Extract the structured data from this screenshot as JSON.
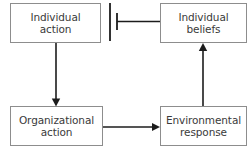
{
  "diagram": {
    "background_color": "#ffffff",
    "box_border_color": "#8d8d8d",
    "connector_color": "#1c1c1c",
    "nodes": [
      {
        "id": "individual-action",
        "label": "Individual\naction",
        "position": "top-left"
      },
      {
        "id": "individual-beliefs",
        "label": "Individual\nbeliefs",
        "position": "top-right"
      },
      {
        "id": "organizational-action",
        "label": "Organizational\naction",
        "position": "bottom-left"
      },
      {
        "id": "environmental-response",
        "label": "Environmental\nresponse",
        "position": "bottom-right"
      }
    ],
    "connectors": [
      {
        "id": "individual-action-to-organizational-action",
        "from": "individual-action",
        "to": "organizational-action",
        "direction": "down",
        "terminator": "arrowhead"
      },
      {
        "id": "organizational-action-to-environmental-response",
        "from": "organizational-action",
        "to": "environmental-response",
        "direction": "right",
        "terminator": "arrowhead"
      },
      {
        "id": "environmental-response-to-individual-beliefs",
        "from": "environmental-response",
        "to": "individual-beliefs",
        "direction": "up",
        "terminator": "arrowhead"
      },
      {
        "id": "individual-beliefs-to-individual-action",
        "from": "individual-beliefs",
        "to": "individual-action",
        "direction": "left",
        "terminator": "blocked-t-bar"
      }
    ],
    "barrier": {
      "id": "loop-barrier",
      "description": "vertical barrier line interrupting the link from individual beliefs back to individual action"
    }
  }
}
